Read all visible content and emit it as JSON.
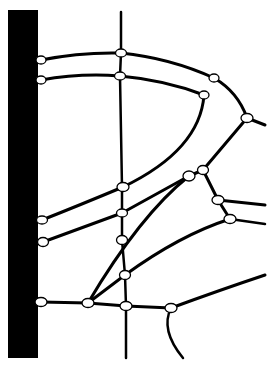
{
  "diagram": {
    "type": "network",
    "colors": {
      "background": "#ffffff",
      "stroke": "#000000",
      "bar": "#000000",
      "node_fill": "#ffffff"
    },
    "bar": {
      "x": 8,
      "y": 10,
      "width": 30,
      "height": 348
    },
    "vertical_line": {
      "x1": 121,
      "y1": 12,
      "x2": 123,
      "y2": 358
    },
    "nodes": [
      {
        "id": "n1",
        "x": 41,
        "y": 60
      },
      {
        "id": "n2",
        "x": 41,
        "y": 80
      },
      {
        "id": "n3",
        "x": 121,
        "y": 53
      },
      {
        "id": "n4",
        "x": 120,
        "y": 76
      },
      {
        "id": "n5",
        "x": 214,
        "y": 78
      },
      {
        "id": "n6",
        "x": 204,
        "y": 95
      },
      {
        "id": "n7",
        "x": 247,
        "y": 118
      },
      {
        "id": "n8",
        "x": 123,
        "y": 187
      },
      {
        "id": "n9",
        "x": 189,
        "y": 176
      },
      {
        "id": "n10",
        "x": 203,
        "y": 170
      },
      {
        "id": "n11",
        "x": 218,
        "y": 200
      },
      {
        "id": "n12",
        "x": 230,
        "y": 219
      },
      {
        "id": "n13",
        "x": 122,
        "y": 213
      },
      {
        "id": "n14",
        "x": 122,
        "y": 240
      },
      {
        "id": "n15",
        "x": 42,
        "y": 220
      },
      {
        "id": "n16",
        "x": 43,
        "y": 242
      },
      {
        "id": "n17",
        "x": 125,
        "y": 275
      },
      {
        "id": "n18",
        "x": 41,
        "y": 302
      },
      {
        "id": "n19",
        "x": 88,
        "y": 303
      },
      {
        "id": "n20",
        "x": 126,
        "y": 306
      },
      {
        "id": "n21",
        "x": 171,
        "y": 308
      }
    ]
  }
}
